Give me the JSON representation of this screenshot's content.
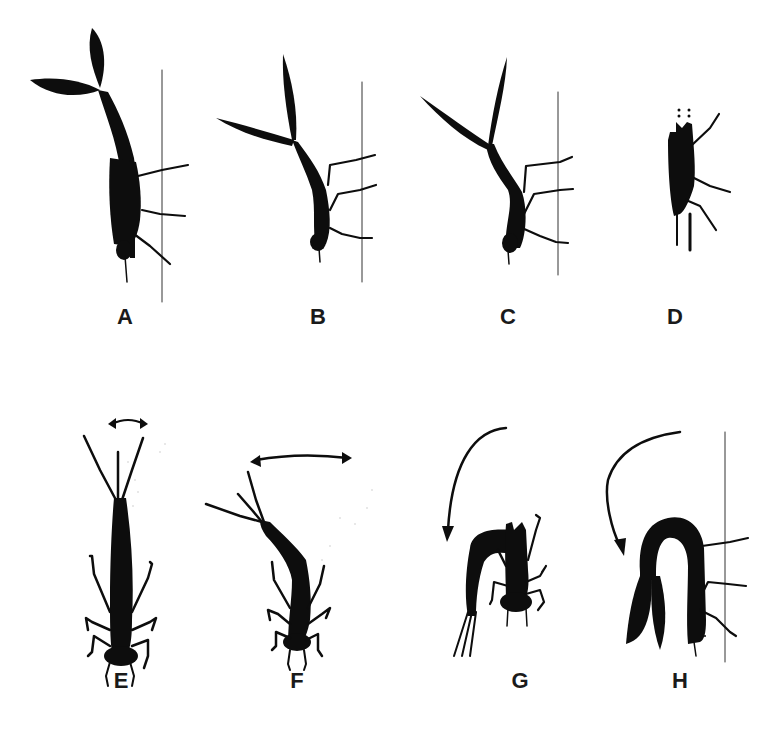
{
  "figure": {
    "panels": [
      {
        "id": "A",
        "label": "A",
        "label_pos": [
          125,
          306
        ],
        "has_substrate_line": true,
        "motion_arrow": "none"
      },
      {
        "id": "B",
        "label": "B",
        "label_pos": [
          318,
          306
        ],
        "has_substrate_line": true,
        "motion_arrow": "none"
      },
      {
        "id": "C",
        "label": "C",
        "label_pos": [
          508,
          306
        ],
        "has_substrate_line": true,
        "motion_arrow": "none"
      },
      {
        "id": "D",
        "label": "D",
        "label_pos": [
          675,
          306
        ],
        "has_substrate_line": false,
        "motion_arrow": "none"
      },
      {
        "id": "E",
        "label": "E",
        "label_pos": [
          121,
          670
        ],
        "has_substrate_line": false,
        "motion_arrow": "double-headed-lateral"
      },
      {
        "id": "F",
        "label": "F",
        "label_pos": [
          297,
          670
        ],
        "has_substrate_line": false,
        "motion_arrow": "double-headed-lateral"
      },
      {
        "id": "G",
        "label": "G",
        "label_pos": [
          520,
          670
        ],
        "has_substrate_line": false,
        "motion_arrow": "curved-downward"
      },
      {
        "id": "H",
        "label": "H",
        "label_pos": [
          680,
          670
        ],
        "has_substrate_line": true,
        "motion_arrow": "curved-downward"
      }
    ],
    "colors": {
      "silhouette": "#0d0d0d",
      "substrate_line": "#333333",
      "background": "#ffffff",
      "label": "#1a1a1a"
    }
  }
}
